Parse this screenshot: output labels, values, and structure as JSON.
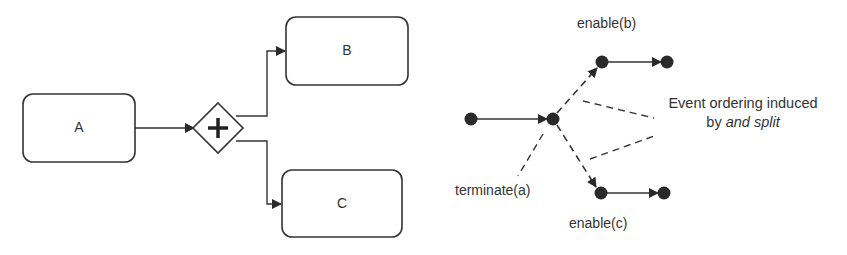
{
  "bpmn": {
    "tasks": [
      {
        "id": "A",
        "label": "A"
      },
      {
        "id": "B",
        "label": "B"
      },
      {
        "id": "C",
        "label": "C"
      }
    ],
    "gateway": {
      "type": "parallel-and-split",
      "icon": "plus-icon"
    }
  },
  "event_graph": {
    "labels": {
      "enable_b": "enable(b)",
      "enable_c": "enable(c)",
      "terminate_a": "terminate(a)"
    },
    "note": {
      "line1": "Event ordering induced",
      "line2_prefix": "by ",
      "line2_italic": "and split"
    }
  },
  "colors": {
    "stroke": "#333333",
    "node_fill": "#2a2a2a",
    "text": "#333333"
  }
}
